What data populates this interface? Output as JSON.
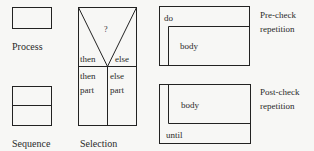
{
  "diagram": {
    "line_color": "#222222",
    "text_color": "#2a2a2a",
    "process": {
      "caption": "Process"
    },
    "sequence": {
      "caption": "Sequence"
    },
    "selection": {
      "caption": "Selection",
      "condition": "?",
      "then_label": "then",
      "else_label": "else",
      "then_part_line1": "then",
      "then_part_line2": "part",
      "else_part_line1": "else",
      "else_part_line2": "part"
    },
    "precheck": {
      "keyword": "do",
      "body": "body",
      "caption_line1": "Pre-check",
      "caption_line2": "repetition"
    },
    "postcheck": {
      "keyword": "until",
      "body": "body",
      "caption_line1": "Post-check",
      "caption_line2": "repetition"
    }
  }
}
